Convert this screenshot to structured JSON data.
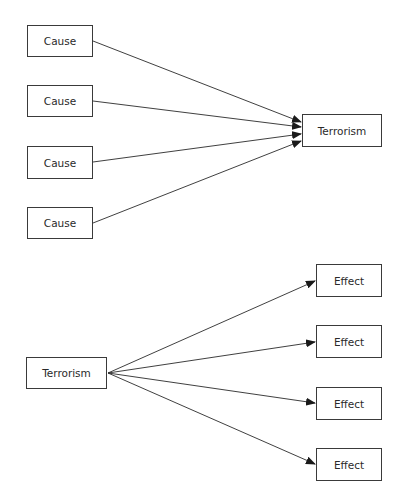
{
  "diagram": {
    "causes_section": {
      "causes": [
        {
          "label": "Cause",
          "x": 27,
          "y": 25,
          "w": 66,
          "h": 32
        },
        {
          "label": "Cause",
          "x": 27,
          "y": 85,
          "w": 66,
          "h": 32
        },
        {
          "label": "Cause",
          "x": 27,
          "y": 146,
          "w": 66,
          "h": 33
        },
        {
          "label": "Cause",
          "x": 27,
          "y": 207,
          "w": 66,
          "h": 32
        }
      ],
      "target": {
        "label": "Terrorism",
        "x": 302,
        "y": 114,
        "w": 80,
        "h": 33
      }
    },
    "effects_section": {
      "source": {
        "label": "Terrorism",
        "x": 26,
        "y": 357,
        "w": 81,
        "h": 32
      },
      "effects": [
        {
          "label": "Effect",
          "x": 316,
          "y": 264,
          "w": 66,
          "h": 33
        },
        {
          "label": "Effect",
          "x": 316,
          "y": 325,
          "w": 66,
          "h": 33
        },
        {
          "label": "Effect",
          "x": 316,
          "y": 387,
          "w": 66,
          "h": 33
        },
        {
          "label": "Effect",
          "x": 316,
          "y": 448,
          "w": 66,
          "h": 33
        }
      ]
    },
    "colors": {
      "line": "#2a2a2a",
      "border": "#3a3a3a",
      "text": "#2a2a2a",
      "background": "#ffffff"
    }
  }
}
